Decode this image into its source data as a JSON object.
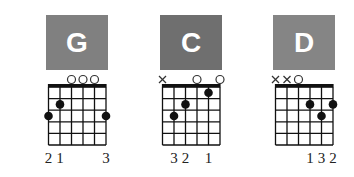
{
  "colors": {
    "box": "#7f7f7f",
    "box_dark": "#6e6e6e",
    "line": "#111111"
  },
  "chords": [
    {
      "name": "G",
      "box_color": "#808080",
      "markers": [
        "",
        "",
        "o",
        "o",
        "o",
        ""
      ],
      "dots": [
        {
          "string": 6,
          "fret": 3
        },
        {
          "string": 5,
          "fret": 2
        },
        {
          "string": 1,
          "fret": 3
        }
      ],
      "fingers": [
        "2",
        "1",
        "",
        "",
        "",
        "3"
      ]
    },
    {
      "name": "C",
      "box_color": "#6f6f6f",
      "markers": [
        "x",
        "",
        "",
        "o",
        "",
        "o"
      ],
      "dots": [
        {
          "string": 5,
          "fret": 3
        },
        {
          "string": 4,
          "fret": 2
        },
        {
          "string": 2,
          "fret": 1
        }
      ],
      "fingers": [
        "",
        "3",
        "2",
        "",
        "1",
        ""
      ]
    },
    {
      "name": "D",
      "box_color": "#858585",
      "markers": [
        "x",
        "x",
        "o",
        "",
        "",
        ""
      ],
      "dots": [
        {
          "string": 3,
          "fret": 2
        },
        {
          "string": 2,
          "fret": 3
        },
        {
          "string": 1,
          "fret": 2
        }
      ],
      "fingers": [
        "",
        "",
        "",
        "1",
        "3",
        "2"
      ]
    }
  ]
}
